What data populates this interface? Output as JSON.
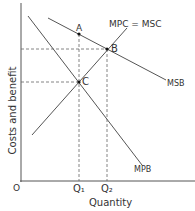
{
  "diagram": {
    "ylabel": "Costs and benefit",
    "xlabel": "Quantity",
    "origin": "O",
    "curves": {
      "msb": "MSB",
      "mpc": "MPC = MSC",
      "mpb": "MPB"
    },
    "points": {
      "a": "A",
      "b": "B",
      "c": "C"
    },
    "ticks": {
      "q1": "Q₁",
      "q2": "Q₂"
    }
  }
}
